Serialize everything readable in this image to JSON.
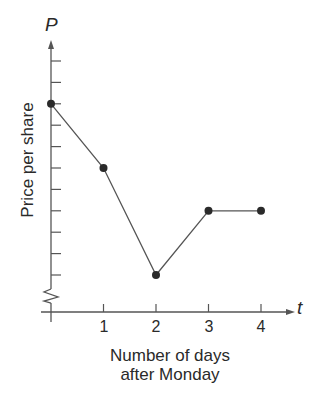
{
  "chart_data": {
    "type": "line",
    "title": "",
    "xlabel": "Number of days after Monday",
    "ylabel": "Price per share",
    "x_axis_variable": "t",
    "y_axis_variable": "P",
    "x": [
      0,
      1,
      2,
      3,
      4
    ],
    "x_tick_labels": [
      "1",
      "2",
      "3",
      "4"
    ],
    "series": [
      {
        "name": "Price per share",
        "values": [
          9,
          6,
          1,
          4,
          4
        ]
      }
    ],
    "y_ticks_unlabeled": 11,
    "y_axis_break": true,
    "xlim": [
      0,
      4.6
    ],
    "ylim": [
      0,
      12
    ],
    "grid": false,
    "legend": "none",
    "markers": "filled circles"
  },
  "labels": {
    "xlabel_line1": "Number of days",
    "xlabel_line2": "after Monday",
    "ylabel": "Price per share",
    "p_var": "P",
    "t_var": "t",
    "ticks": [
      "1",
      "2",
      "3",
      "4"
    ]
  },
  "colors": {
    "line": "#555555",
    "point": "#2a2a2a",
    "axis": "#555555"
  }
}
